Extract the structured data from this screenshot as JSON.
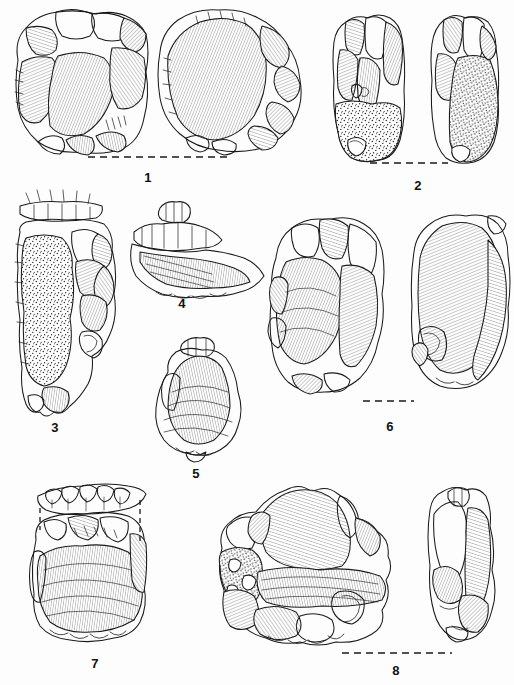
{
  "plate": {
    "title": "Lithic artefact illustration plate",
    "description": "Pen-and-ink archaeological drawing plate of eight flaked stone artefacts (cores, flakes and scrapers), each shown in one or two views with dashed orientation lines.",
    "background_color": "#fdfdfd",
    "ink_color": "#1a1a1a",
    "width": 514,
    "height": 685,
    "technique": "line drawing with ripple hatching and stippled cortex"
  },
  "figures": [
    {
      "number": "1",
      "label_x": 148,
      "label_y": 177,
      "views": 2,
      "view_names": [
        "dorsal",
        "ventral"
      ],
      "has_cortex_stipple": false,
      "scale_line": {
        "x1": 88,
        "y1": 157,
        "x2": 228,
        "y2": 157
      },
      "caption": "Discoidal core, two views"
    },
    {
      "number": "2",
      "label_x": 418,
      "label_y": 185,
      "views": 2,
      "view_names": [
        "dorsal",
        "lateral"
      ],
      "has_cortex_stipple": true,
      "scale_line": {
        "x1": 370,
        "y1": 163,
        "x2": 448,
        "y2": 163
      },
      "caption": "Elongated core with cortex, two views"
    },
    {
      "number": "3",
      "label_x": 55,
      "label_y": 427,
      "views": 1,
      "view_names": [
        "dorsal"
      ],
      "has_cortex_stipple": true,
      "scale_line": null,
      "caption": "Cortical flake with retouched platform"
    },
    {
      "number": "4",
      "label_x": 182,
      "label_y": 303,
      "views": 1,
      "view_names": [
        "dorsal"
      ],
      "has_cortex_stipple": false,
      "scale_line": null,
      "caption": "Small flake with denticulate edge"
    },
    {
      "number": "5",
      "label_x": 196,
      "label_y": 473,
      "views": 1,
      "view_names": [
        "ventral"
      ],
      "has_cortex_stipple": false,
      "scale_line": null,
      "caption": "Flake with prominent bulb of percussion"
    },
    {
      "number": "6",
      "label_x": 390,
      "label_y": 426,
      "views": 2,
      "view_names": [
        "dorsal",
        "ventral"
      ],
      "has_cortex_stipple": false,
      "scale_line": {
        "x1": 363,
        "y1": 401,
        "x2": 414,
        "y2": 401
      },
      "caption": "Large flake, two views"
    },
    {
      "number": "7",
      "label_x": 95,
      "label_y": 663,
      "views": 2,
      "view_names": [
        "profile",
        "dorsal"
      ],
      "has_cortex_stipple": false,
      "scale_line": null,
      "caption": "Side scraper with separate profile view"
    },
    {
      "number": "8",
      "label_x": 396,
      "label_y": 670,
      "views": 2,
      "view_names": [
        "dorsal",
        "lateral"
      ],
      "has_cortex_stipple": true,
      "scale_line": {
        "x1": 342,
        "y1": 653,
        "x2": 452,
        "y2": 653
      },
      "caption": "Core with cortex remnant, two views"
    }
  ]
}
